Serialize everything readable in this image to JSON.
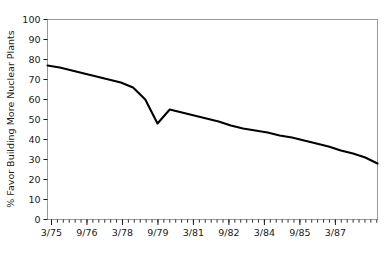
{
  "chart_data": {
    "type": "line",
    "title": "",
    "xlabel": "",
    "ylabel": "% Favor Building More Nuclear Plants",
    "ylim": [
      0,
      100
    ],
    "ytick_labels": [
      "0",
      "10",
      "20",
      "30",
      "40",
      "50",
      "60",
      "70",
      "80",
      "90",
      "100"
    ],
    "ytick_values": [
      0,
      10,
      20,
      30,
      40,
      50,
      60,
      70,
      80,
      90,
      100
    ],
    "xtick_labels": [
      "3/75",
      "9/76",
      "3/78",
      "9/79",
      "3/81",
      "9/82",
      "3/84",
      "9/85",
      "3/87"
    ],
    "grid": false,
    "legend": null,
    "line_color": "#000000",
    "frame_color": "#9a9a9a",
    "x": [
      "3/75",
      "9/75",
      "3/76",
      "9/76",
      "3/77",
      "9/77",
      "3/78",
      "9/78",
      "3/79",
      "6/79",
      "9/79",
      "3/80",
      "9/80",
      "3/81",
      "9/81",
      "3/82",
      "9/82",
      "3/83",
      "9/83",
      "3/84",
      "9/84",
      "3/85",
      "9/85",
      "3/86",
      "9/86",
      "3/87",
      "9/87",
      "3/88"
    ],
    "values": [
      77,
      76,
      74.5,
      73,
      71.5,
      70,
      68.5,
      66,
      60,
      48,
      55,
      53.5,
      52,
      50.5,
      49,
      47,
      45.5,
      44.5,
      43.5,
      42,
      41,
      39.5,
      38,
      36.5,
      34.5,
      33,
      31,
      28
    ],
    "annotations": []
  },
  "axis": {
    "y_title": "% Favor Building More Nuclear Plants"
  }
}
